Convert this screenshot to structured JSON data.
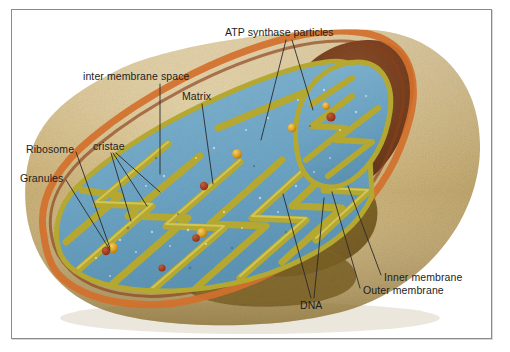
{
  "figure": {
    "frame_color": "#8a8a8a",
    "background_color": "#ffffff"
  },
  "palette": {
    "outer_body": "#cdb379",
    "outer_body_light": "#ddc793",
    "outer_body_shade": "#b39a61",
    "outer_membrane_rim": "#d2702c",
    "cut_interior_dark": "#7a4a2a",
    "cut_interior_olive": "#8a6f2c",
    "matrix_blue": "#6fa8c8",
    "cristae_yellow": "#b5a830",
    "cristae_highlight": "#d6ca5a",
    "granule_orange": "#e0a327",
    "ribosome_red": "#a33b22",
    "label_text": "#1d1d1d",
    "leader_line": "#2a2a2a"
  },
  "labels": {
    "atp_synthase": "ATP synthase particles",
    "inter_membrane_space": "inter membrane space",
    "matrix": "Matrix",
    "ribosome": "Ribosome",
    "cristae": "cristae",
    "granules": "Granules",
    "inner_membrane": "Inner membrane",
    "outer_membrane": "Outer membrane",
    "dna": "DNA"
  },
  "label_list": [
    {
      "id": "atp-synthase",
      "text": "ATP synthase particles",
      "x": 225,
      "y": 26,
      "leaders": 2
    },
    {
      "id": "inter-membrane-space",
      "text": "inter membrane space",
      "x": 83,
      "y": 70,
      "leaders": 1
    },
    {
      "id": "matrix",
      "text": "Matrix",
      "x": 182,
      "y": 90,
      "leaders": 1
    },
    {
      "id": "ribosome",
      "text": "Ribosome",
      "x": 26,
      "y": 143,
      "leaders": 1
    },
    {
      "id": "cristae",
      "text": "cristae",
      "x": 93,
      "y": 140,
      "leaders": 3
    },
    {
      "id": "granules",
      "text": "Granules",
      "x": 20,
      "y": 172,
      "leaders": 1
    },
    {
      "id": "inner-membrane",
      "text": "Inner membrane",
      "x": 384,
      "y": 271,
      "leaders": 1
    },
    {
      "id": "outer-membrane",
      "text": "Outer membrane",
      "x": 363,
      "y": 284,
      "leaders": 1
    },
    {
      "id": "dna",
      "text": "DNA",
      "x": 300,
      "y": 299,
      "leaders": 2
    }
  ],
  "structures": [
    {
      "name": "outer-membrane",
      "description": "tan outer surface of the organelle"
    },
    {
      "name": "inner-membrane",
      "description": "membrane folded into cristae"
    },
    {
      "name": "inter-membrane-space",
      "description": "space between the outer and inner membranes"
    },
    {
      "name": "matrix",
      "description": "blue interior fluid compartment"
    },
    {
      "name": "cristae",
      "description": "yellow-olive folds of the inner membrane"
    },
    {
      "name": "granules",
      "description": "small orange-yellow matrix granules"
    },
    {
      "name": "ribosome",
      "description": "dark red particles in the matrix"
    },
    {
      "name": "dna",
      "description": "mitochondrial DNA strands"
    },
    {
      "name": "atp-synthase-particles",
      "description": "particles studding the cristae"
    }
  ]
}
